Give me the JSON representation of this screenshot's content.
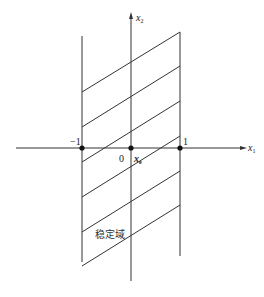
{
  "diagram": {
    "type": "stability-region",
    "axes": {
      "x_label": "x",
      "x_sub": "1",
      "y_label": "x",
      "y_sub": "2"
    },
    "points": [
      {
        "label": "−1"
      },
      {
        "label": "0"
      },
      {
        "label": "1"
      }
    ],
    "origin_var": {
      "label": "x",
      "sub": "e"
    },
    "region_label": "稳定域",
    "colors": {
      "line": "#333333",
      "point": "#111111",
      "background": "#ffffff"
    }
  }
}
